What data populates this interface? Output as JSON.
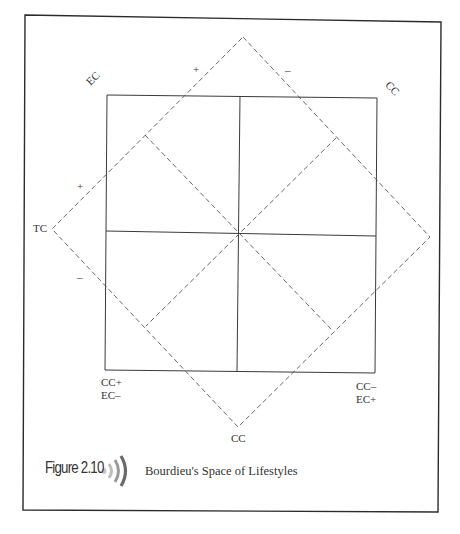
{
  "figure": {
    "number": "Figure 2.10",
    "title": "Bourdieu's Space of Lifestyles",
    "icon": "audio-speaker-icon"
  },
  "labels": {
    "ec_top_left": "EC",
    "cc_top_right": "CC",
    "tc_left": "TC",
    "cc_bottom": "CC",
    "bottom_left_1": "CC+",
    "bottom_left_2": "EC–",
    "bottom_right_1": "CC–",
    "bottom_right_2": "EC+"
  },
  "signs": {
    "top_left_plus": "+",
    "top_right_minus": "–",
    "left_plus": "+",
    "left_minus": "–"
  },
  "colors": {
    "line": "#333333",
    "dash": "#555555",
    "icon_dark": "#6a6a6a",
    "icon_light": "#bdbdbd"
  },
  "geometry": {
    "outer_frame": [
      25,
      15,
      441,
      512
    ],
    "inner_square": [
      107,
      95,
      377,
      372
    ],
    "center": [
      238,
      233
    ],
    "big_diamond": {
      "top": [
        243,
        37
      ],
      "right": [
        430,
        237
      ],
      "bottom": [
        238,
        427
      ],
      "left": [
        52,
        229
      ]
    }
  }
}
